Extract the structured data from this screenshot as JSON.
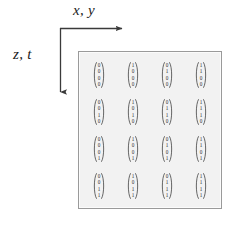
{
  "figure": {
    "axes": {
      "horizontal": {
        "label": "x, y",
        "icon": "arrow-right-icon",
        "direction": "right"
      },
      "vertical": {
        "label": "z, t",
        "icon": "arrow-down-icon",
        "direction": "down"
      },
      "corner_note": "L-shaped axis indicator, origin at top-left of grid"
    },
    "colors": {
      "box_fill": "#f2f2f2",
      "box_border": "#9a9a9a",
      "text": "#1c1c1c",
      "entry_text": "#2a2a2a",
      "arrow": "#3a3a3a"
    },
    "grid": {
      "rows": 4,
      "columns": 4,
      "vector_length": 4,
      "cells": [
        [
          {
            "name": "vector-r1c1",
            "entries": [
              "0",
              "0",
              "0",
              "0"
            ]
          },
          {
            "name": "vector-r1c2",
            "entries": [
              "1",
              "0",
              "0",
              "0"
            ]
          },
          {
            "name": "vector-r1c3",
            "entries": [
              "0",
              "1",
              "0",
              "0"
            ]
          },
          {
            "name": "vector-r1c4",
            "entries": [
              "1",
              "1",
              "0",
              "0"
            ]
          }
        ],
        [
          {
            "name": "vector-r2c1",
            "entries": [
              "0",
              "0",
              "1",
              "0"
            ]
          },
          {
            "name": "vector-r2c2",
            "entries": [
              "1",
              "0",
              "1",
              "0"
            ]
          },
          {
            "name": "vector-r2c3",
            "entries": [
              "0",
              "1",
              "1",
              "0"
            ]
          },
          {
            "name": "vector-r2c4",
            "entries": [
              "1",
              "1",
              "1",
              "0"
            ]
          }
        ],
        [
          {
            "name": "vector-r3c1",
            "entries": [
              "0",
              "0",
              "0",
              "1"
            ]
          },
          {
            "name": "vector-r3c2",
            "entries": [
              "1",
              "0",
              "0",
              "1"
            ]
          },
          {
            "name": "vector-r3c3",
            "entries": [
              "0",
              "1",
              "0",
              "1"
            ]
          },
          {
            "name": "vector-r3c4",
            "entries": [
              "1",
              "1",
              "0",
              "1"
            ]
          }
        ],
        [
          {
            "name": "vector-r4c1",
            "entries": [
              "0",
              "0",
              "1",
              "1"
            ]
          },
          {
            "name": "vector-r4c2",
            "entries": [
              "1",
              "0",
              "1",
              "1"
            ]
          },
          {
            "name": "vector-r4c3",
            "entries": [
              "0",
              "1",
              "1",
              "1"
            ]
          },
          {
            "name": "vector-r4c4",
            "entries": [
              "1",
              "1",
              "1",
              "1"
            ]
          }
        ]
      ]
    }
  }
}
